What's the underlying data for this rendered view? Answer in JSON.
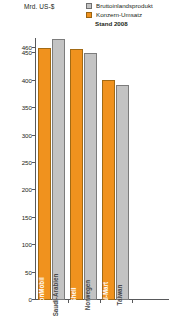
{
  "unit_label": "Mrd. US-$",
  "stand_label": "Stand 2008",
  "legend": {
    "items": [
      {
        "label": "Bruttoinlandsprodukt",
        "color": "#c3c3c3",
        "swatch": "gray"
      },
      {
        "label": "Konzern-Umsatz",
        "color": "#f0921e",
        "swatch": "orange"
      }
    ]
  },
  "colors": {
    "gdp_gray": "#c3c3c3",
    "revenue_orange": "#f0921e",
    "axis": "#58595b",
    "text": "#231f20"
  },
  "chart_data": {
    "type": "bar",
    "title": "",
    "subtitle": "Stand 2008",
    "xlabel": "",
    "ylabel": "Mrd. US-$",
    "ylim": [
      0,
      478
    ],
    "grid": false,
    "legend_position": "top-right",
    "tick_labels": [
      "460",
      "450",
      "400",
      "350",
      "300",
      "250",
      "200",
      "150",
      "100",
      "50",
      "0"
    ],
    "tick_values": [
      460,
      450,
      400,
      350,
      300,
      250,
      200,
      150,
      100,
      50,
      0
    ],
    "categories": [
      "ExxonMobil",
      "Saudi-Arabien",
      "Shell",
      "Norwegen",
      "Wal-Mart",
      "Taiwan"
    ],
    "values": [
      460,
      476,
      458,
      451,
      401,
      392
    ],
    "series": [
      {
        "name": "Konzern-Umsatz",
        "color": "#f0921e",
        "points": [
          {
            "category": "ExxonMobil",
            "value": 460
          },
          {
            "category": "Shell",
            "value": 458
          },
          {
            "category": "Wal-Mart",
            "value": 401
          }
        ]
      },
      {
        "name": "Bruttoinlandsprodukt",
        "color": "#c3c3c3",
        "points": [
          {
            "category": "Saudi-Arabien",
            "value": 476
          },
          {
            "category": "Norwegen",
            "value": 451
          },
          {
            "category": "Taiwan",
            "value": 392
          }
        ]
      }
    ],
    "bars": [
      {
        "category": "ExxonMobil",
        "value": 460,
        "kind": "revenue",
        "swatch": "orange"
      },
      {
        "category": "Saudi-Arabien",
        "value": 476,
        "kind": "gdp",
        "swatch": "gray"
      },
      {
        "category": "Shell",
        "value": 458,
        "kind": "revenue",
        "swatch": "orange"
      },
      {
        "category": "Norwegen",
        "value": 451,
        "kind": "gdp",
        "swatch": "gray"
      },
      {
        "category": "Wal-Mart",
        "value": 401,
        "kind": "revenue",
        "swatch": "orange"
      },
      {
        "category": "Taiwan",
        "value": 392,
        "kind": "gdp",
        "swatch": "gray"
      }
    ]
  }
}
